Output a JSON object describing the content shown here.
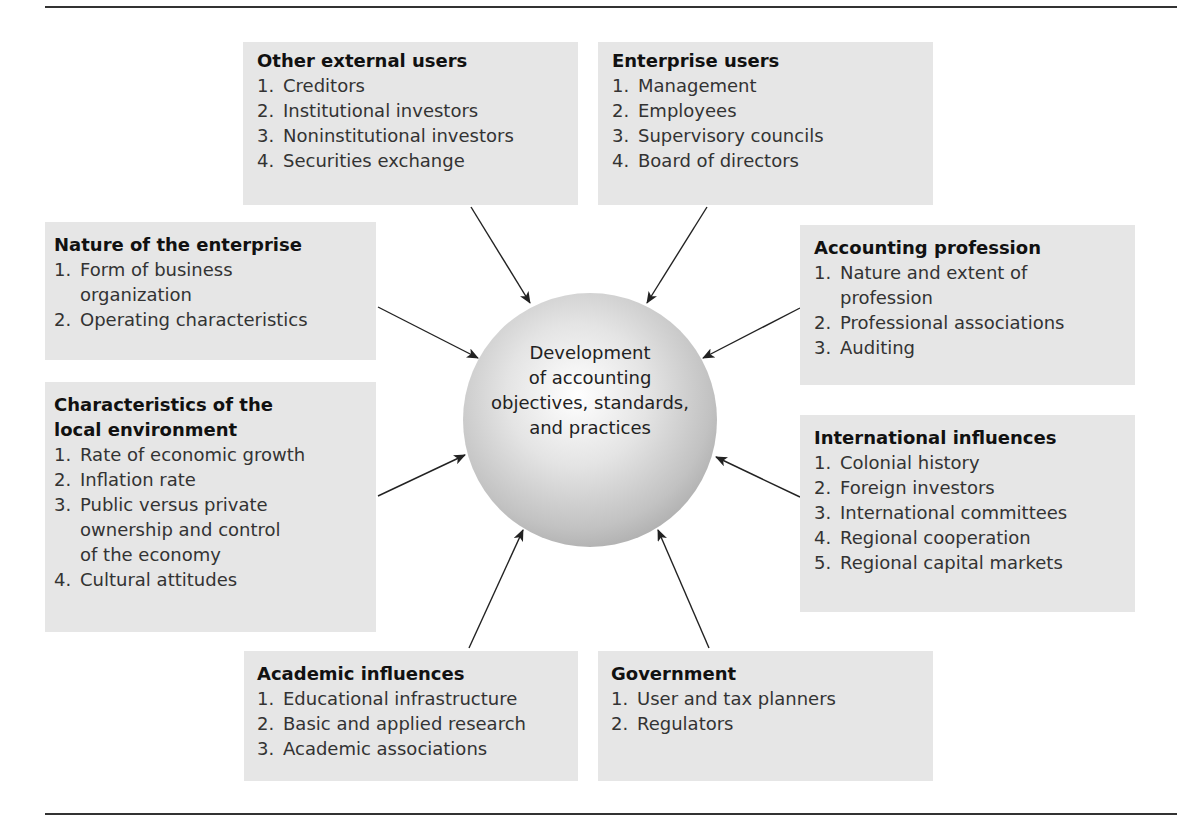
{
  "center": {
    "label": "Development\nof accounting\nobjectives, standards,\nand practices"
  },
  "boxes": {
    "other_external_users": {
      "title": "Other external users",
      "items": [
        "Creditors",
        "Institutional investors",
        "Noninstitutional investors",
        "Securities exchange"
      ]
    },
    "enterprise_users": {
      "title": "Enterprise users",
      "items": [
        "Management",
        "Employees",
        "Supervisory councils",
        "Board of directors"
      ]
    },
    "nature_of_enterprise": {
      "title": "Nature of the enterprise",
      "items": [
        "Form of business\norganization",
        "Operating characteristics"
      ]
    },
    "accounting_profession": {
      "title": "Accounting profession",
      "items": [
        "Nature and extent of\nprofession",
        "Professional associations",
        "Auditing"
      ]
    },
    "local_environment": {
      "title": "Characteristics of the\nlocal environment",
      "items": [
        "Rate of economic growth",
        "Inflation rate",
        "Public versus private\nownership and control\nof the economy",
        "Cultural attitudes"
      ]
    },
    "international_influences": {
      "title": "International influences",
      "items": [
        "Colonial history",
        "Foreign investors",
        "International committees",
        "Regional cooperation",
        "Regional capital markets"
      ]
    },
    "academic_influences": {
      "title": "Academic influences",
      "items": [
        "Educational infrastructure",
        "Basic and applied research",
        "Academic associations"
      ]
    },
    "government": {
      "title": "Government",
      "items": [
        "User and tax planners",
        "Regulators"
      ]
    }
  },
  "numbers": [
    "1.",
    "2.",
    "3.",
    "4.",
    "5."
  ]
}
